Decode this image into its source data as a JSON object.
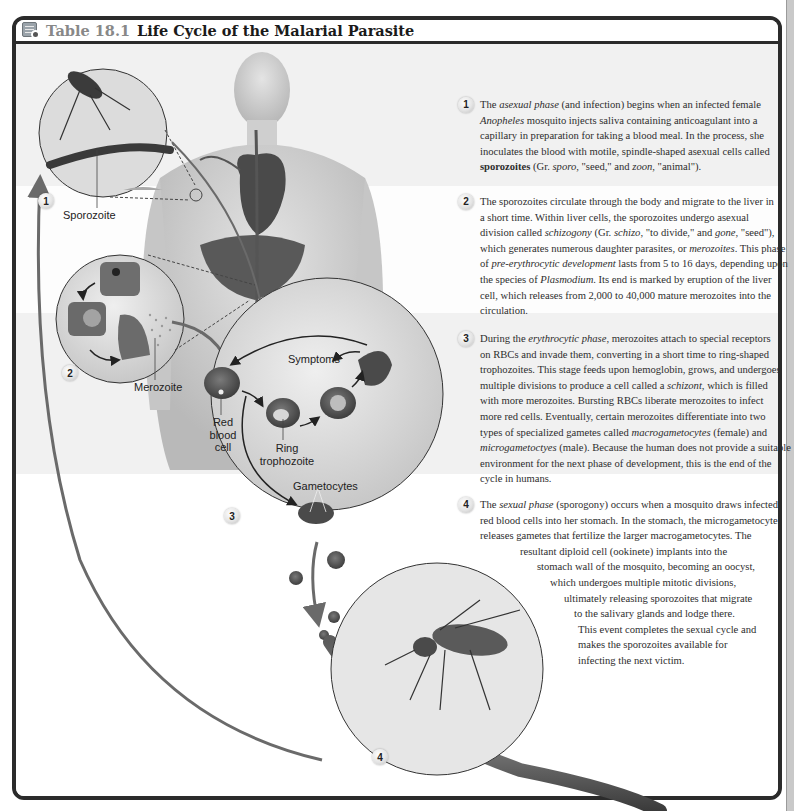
{
  "title": {
    "icon": "table-icon",
    "label": "Table 18.1",
    "text": "Life Cycle of the Malarial Parasite"
  },
  "diagram": {
    "labels": {
      "sporozoite": "Sporozoite",
      "merozoite": "Merozoite",
      "symptoms": "Symptoms",
      "red_blood_cell": [
        "Red",
        "blood",
        "cell"
      ],
      "ring_trophozoite": [
        "Ring",
        "trophozoite"
      ],
      "gametocytes": "Gametocytes"
    },
    "badges": [
      "1",
      "2",
      "3",
      "4"
    ]
  },
  "steps": [
    {
      "number": "1",
      "lines": [
        [
          {
            "t": "The "
          },
          {
            "i": "asexual phase"
          },
          {
            "t": " (and infection) begins when an infected female"
          }
        ],
        [
          {
            "i": "Anopheles"
          },
          {
            "t": " mosquito injects saliva containing anticoagulant into a"
          }
        ],
        [
          {
            "t": "capillary in preparation for taking a blood meal. In the process, she"
          }
        ],
        [
          {
            "t": "inoculates the blood with motile, spindle-shaped asexual cells called"
          }
        ],
        [
          {
            "b": "sporozoites"
          },
          {
            "t": " (Gr. "
          },
          {
            "i": "sporo"
          },
          {
            "t": ", \"seed,\" and "
          },
          {
            "i": "zoon"
          },
          {
            "t": ", \"animal\")."
          }
        ]
      ]
    },
    {
      "number": "2",
      "lines": [
        [
          {
            "t": "The sporozoites circulate through the body and migrate to the liver in"
          }
        ],
        [
          {
            "t": "a short time. Within liver cells, the sporozoites undergo asexual"
          }
        ],
        [
          {
            "t": "division called "
          },
          {
            "i": "schizogony"
          },
          {
            "t": " (Gr. "
          },
          {
            "i": "schizo"
          },
          {
            "t": ", \"to divide,\" and "
          },
          {
            "i": "gone"
          },
          {
            "t": ", \"seed\"),"
          }
        ],
        [
          {
            "t": "which generates numerous daughter parasites, or "
          },
          {
            "i": "merozoites"
          },
          {
            "t": ". This phase"
          }
        ],
        [
          {
            "t": "of "
          },
          {
            "i": "pre-erythrocytic development"
          },
          {
            "t": " lasts from 5 to 16 days, depending upon"
          }
        ],
        [
          {
            "t": "the species of "
          },
          {
            "i": "Plasmodium"
          },
          {
            "t": ". Its end is marked by eruption of the liver"
          }
        ],
        [
          {
            "t": "cell, which releases from 2,000 to 40,000 mature merozoites into the"
          }
        ],
        [
          {
            "t": "circulation."
          }
        ]
      ]
    },
    {
      "number": "3",
      "lines": [
        [
          {
            "t": "During the "
          },
          {
            "i": "erythrocytic phase"
          },
          {
            "t": ", merozoites attach to special receptors"
          }
        ],
        [
          {
            "t": "on RBCs and invade them, converting in a short time to ring-shaped"
          }
        ],
        [
          {
            "t": "trophozoites. This stage feeds upon hemoglobin, grows, and undergoes"
          }
        ],
        [
          {
            "t": "multiple divisions to produce a cell called a "
          },
          {
            "i": "schizont"
          },
          {
            "t": ", which is filled"
          }
        ],
        [
          {
            "t": "with more merozoites. Bursting RBCs liberate merozoites to infect"
          }
        ],
        [
          {
            "t": "more red cells. Eventually, certain merozoites differentiate into two"
          }
        ],
        [
          {
            "t": "types of specialized gametes called "
          },
          {
            "i": "macrogametocytes"
          },
          {
            "t": " (female) and"
          }
        ],
        [
          {
            "i": "microgametoctyes"
          },
          {
            "t": " (male). Because the human does not provide a suitable"
          }
        ],
        [
          {
            "t": "environment for the next phase of development, this is the end of the"
          }
        ],
        [
          {
            "t": "cycle in humans."
          }
        ]
      ]
    },
    {
      "number": "4",
      "lines": [
        [
          {
            "t": "The "
          },
          {
            "i": "sexual phase"
          },
          {
            "t": " (sporogony) occurs when a mosquito draws infected"
          }
        ],
        [
          {
            "t": "red blood cells into her stomach. In the stomach, the microgametocyte"
          }
        ],
        [
          {
            "t": "releases gametes that fertilize the larger macrogametocytes. The"
          }
        ],
        [
          {
            "t": "resultant diploid cell (ookinete) implants into the"
          }
        ],
        [
          {
            "t": "stomach wall of the mosquito, becoming an oocyst,"
          }
        ],
        [
          {
            "t": "which undergoes multiple mitotic divisions,"
          }
        ],
        [
          {
            "t": "ultimately releasing sporozoites that migrate"
          }
        ],
        [
          {
            "t": "to the salivary glands and lodge there."
          }
        ],
        [
          {
            "t": "This event completes the sexual cycle and"
          }
        ],
        [
          {
            "t": "makes the sporozoites available for"
          }
        ],
        [
          {
            "t": "infecting the next victim."
          }
        ]
      ],
      "line_indents": [
        0,
        0,
        0,
        40,
        57,
        70,
        84,
        94,
        98,
        98,
        98
      ]
    }
  ],
  "colors": {
    "frame": "#2b2b2b",
    "shaded_band": "#f1f1f1",
    "title_label": "#888888",
    "arrow": "#6a6a6a"
  }
}
